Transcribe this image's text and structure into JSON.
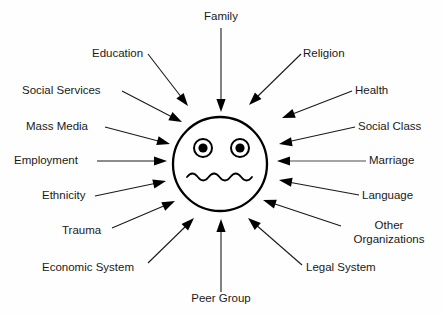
{
  "diagram": {
    "center": {
      "name": "individual-face",
      "shape": "circle",
      "cx": 220,
      "cy": 164,
      "r": 47,
      "eyes": [
        {
          "cx": 203,
          "cy": 148,
          "r_outer": 9,
          "r_pupil": 4.6
        },
        {
          "cx": 240,
          "cy": 148,
          "r_outer": 9,
          "r_pupil": 4.6
        }
      ],
      "mouth": "wavy"
    },
    "colors": {
      "background": "#fefefe",
      "stroke": "#000000",
      "text": "#1a1a1a",
      "connector": "#1a1a1a"
    },
    "nodes": [
      {
        "id": "family",
        "label": "Family",
        "anchor": "middle",
        "tx": 221,
        "ty": 20,
        "line": {
          "x1": 221,
          "y1": 28,
          "x2": 221,
          "y2": 104
        },
        "arrow": {
          "x": 221,
          "y": 112,
          "angle": 90
        }
      },
      {
        "id": "education",
        "label": "Education",
        "anchor": "start",
        "tx": 92,
        "ty": 57,
        "line": {
          "x1": 148,
          "y1": 54,
          "x2": 182,
          "y2": 98
        },
        "arrow": {
          "x": 188,
          "y": 106,
          "angle": 52
        }
      },
      {
        "id": "religion",
        "label": "Religion",
        "anchor": "start",
        "tx": 303,
        "ty": 57,
        "line": {
          "x1": 301,
          "y1": 54,
          "x2": 256,
          "y2": 98
        },
        "arrow": {
          "x": 249,
          "y": 105,
          "angle": 135
        }
      },
      {
        "id": "social-services",
        "label": "Social Services",
        "anchor": "start",
        "tx": 22,
        "ty": 94,
        "line": {
          "x1": 122,
          "y1": 91,
          "x2": 174,
          "y2": 118
        },
        "arrow": {
          "x": 182,
          "y": 122,
          "angle": 27
        }
      },
      {
        "id": "health",
        "label": "Health",
        "anchor": "start",
        "tx": 355,
        "ty": 94,
        "line": {
          "x1": 352,
          "y1": 91,
          "x2": 290,
          "y2": 115
        },
        "arrow": {
          "x": 282,
          "y": 118,
          "angle": 159
        }
      },
      {
        "id": "mass-media",
        "label": "Mass Media",
        "anchor": "start",
        "tx": 26,
        "ty": 130,
        "line": {
          "x1": 105,
          "y1": 127,
          "x2": 162,
          "y2": 142
        },
        "arrow": {
          "x": 170,
          "y": 144,
          "angle": 15
        }
      },
      {
        "id": "social-class",
        "label": "Social Class",
        "anchor": "start",
        "tx": 358,
        "ty": 130,
        "line": {
          "x1": 355,
          "y1": 127,
          "x2": 287,
          "y2": 142
        },
        "arrow": {
          "x": 279,
          "y": 144,
          "angle": 170
        }
      },
      {
        "id": "employment",
        "label": "Employment",
        "anchor": "start",
        "tx": 14,
        "ty": 164,
        "line": {
          "x1": 97,
          "y1": 161,
          "x2": 158,
          "y2": 161
        },
        "arrow": {
          "x": 167,
          "y": 161,
          "angle": 0
        }
      },
      {
        "id": "marriage",
        "label": "Marriage",
        "anchor": "start",
        "tx": 369,
        "ty": 164,
        "line": {
          "x1": 366,
          "y1": 161,
          "x2": 286,
          "y2": 161
        },
        "arrow": {
          "x": 277,
          "y": 161,
          "angle": 180
        }
      },
      {
        "id": "ethnicity",
        "label": "Ethnicity",
        "anchor": "start",
        "tx": 42,
        "ty": 199,
        "line": {
          "x1": 95,
          "y1": 196,
          "x2": 157,
          "y2": 183
        },
        "arrow": {
          "x": 166,
          "y": 181,
          "angle": -13
        }
      },
      {
        "id": "language",
        "label": "Language",
        "anchor": "start",
        "tx": 362,
        "ty": 199,
        "line": {
          "x1": 359,
          "y1": 195,
          "x2": 288,
          "y2": 182
        },
        "arrow": {
          "x": 279,
          "y": 180,
          "angle": 190
        }
      },
      {
        "id": "trauma",
        "label": "Trauma",
        "anchor": "start",
        "tx": 62,
        "ty": 234,
        "line": {
          "x1": 112,
          "y1": 228,
          "x2": 166,
          "y2": 205
        },
        "arrow": {
          "x": 175,
          "y": 201,
          "angle": -25
        }
      },
      {
        "id": "other-organizations",
        "label": "Other",
        "label2": "Organizations",
        "anchor": "middle",
        "tx": 389,
        "ty": 229,
        "tx2": 389,
        "ty2": 243,
        "line": {
          "x1": 341,
          "y1": 226,
          "x2": 272,
          "y2": 203
        },
        "arrow": {
          "x": 263,
          "y": 200,
          "angle": 198
        }
      },
      {
        "id": "economic-system",
        "label": "Economic System",
        "anchor": "start",
        "tx": 42,
        "ty": 271,
        "line": {
          "x1": 148,
          "y1": 263,
          "x2": 187,
          "y2": 225
        },
        "arrow": {
          "x": 194,
          "y": 218,
          "angle": -45
        }
      },
      {
        "id": "legal-system",
        "label": "Legal System",
        "anchor": "start",
        "tx": 306,
        "ty": 271,
        "line": {
          "x1": 302,
          "y1": 265,
          "x2": 255,
          "y2": 224
        },
        "arrow": {
          "x": 248,
          "y": 218,
          "angle": 221
        }
      },
      {
        "id": "peer-group",
        "label": "Peer Group",
        "anchor": "middle",
        "tx": 221,
        "ty": 302,
        "line": {
          "x1": 221,
          "y1": 292,
          "x2": 221,
          "y2": 228
        },
        "arrow": {
          "x": 221,
          "y": 219,
          "angle": -90
        }
      }
    ]
  }
}
